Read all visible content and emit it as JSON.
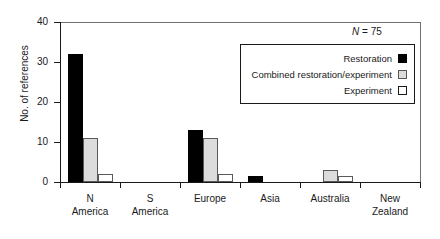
{
  "chart_data": {
    "type": "bar",
    "title": "",
    "xlabel": "",
    "ylabel": "No. of references",
    "ylim": [
      0,
      40
    ],
    "yticks": [
      0,
      10,
      20,
      30,
      40
    ],
    "grid": false,
    "legend_position": "upper-right-inside",
    "annotation": "N = 75",
    "annotation_prefix": "N",
    "annotation_suffix": " = 75",
    "categories": [
      "N America",
      "S America",
      "Europe",
      "Asia",
      "Australia",
      "New Zealand"
    ],
    "category_lines": [
      [
        "N",
        "America"
      ],
      [
        "S",
        "America"
      ],
      [
        "Europe",
        ""
      ],
      [
        "Asia",
        ""
      ],
      [
        "Australia",
        ""
      ],
      [
        "New",
        "Zealand"
      ]
    ],
    "series": [
      {
        "name": "Restoration",
        "color": "#000000",
        "values": [
          32,
          0,
          13,
          1.5,
          0,
          0
        ]
      },
      {
        "name": "Combined restoration/experiment",
        "color": "#dcdcdc",
        "values": [
          11,
          0,
          11,
          0,
          3,
          0
        ]
      },
      {
        "name": "Experiment",
        "color": "#ffffff",
        "values": [
          2,
          0,
          2,
          0,
          1.5,
          0
        ]
      }
    ]
  },
  "axis": {
    "y_title": "No. of references",
    "y_tick_labels": [
      "0",
      "10",
      "20",
      "30",
      "40"
    ]
  },
  "legend": {
    "entries": [
      {
        "label": "Restoration",
        "swatch": "restoration"
      },
      {
        "label": "Combined restoration/experiment",
        "swatch": "combined"
      },
      {
        "label": "Experiment",
        "swatch": "experiment"
      }
    ]
  },
  "colors": {
    "restoration": "#000000",
    "combined": "#dcdcdc",
    "experiment": "#ffffff",
    "axis": "#1a1a1a",
    "frame": "#6f6f6f"
  }
}
